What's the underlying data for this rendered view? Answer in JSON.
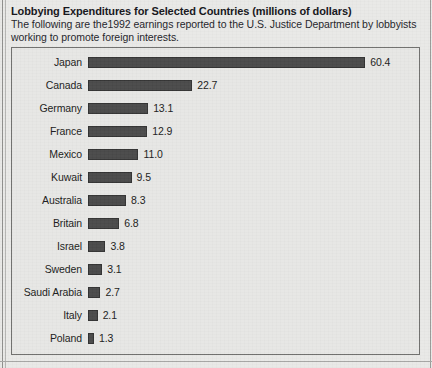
{
  "header": {
    "title": "Lobbying Expenditures for Selected Countries (millions of dollars)",
    "subtitle_line1": "The following are the1992 earnings reported to the U.S. Justice Department by lobbyists",
    "subtitle_line2": "working to promote foreign interests."
  },
  "colors": {
    "bar_fill": "#4a4a4a",
    "bar_stroke": "#333333",
    "plot_background": "#e7e7e5",
    "plot_border": "#6f6f6d",
    "page_background": "#e9e9e7",
    "text": "#1b1b20"
  },
  "chart_data": {
    "type": "bar",
    "orientation": "horizontal",
    "title": "Lobbying Expenditures for Selected Countries (millions of dollars)",
    "subtitle": "The following are the1992 earnings reported to the U.S. Justice Department by lobbyists working to promote foreign interests.",
    "xlabel": "",
    "ylabel": "",
    "unit": "millions of dollars",
    "grid": false,
    "legend": false,
    "xlim": [
      0,
      60.4
    ],
    "categories": [
      "Japan",
      "Canada",
      "Germany",
      "France",
      "Mexico",
      "Kuwait",
      "Australia",
      "Britain",
      "Israel",
      "Sweden",
      "Saudi Arabia",
      "Italy",
      "Poland"
    ],
    "values": [
      60.4,
      22.7,
      13.1,
      12.9,
      11.0,
      9.5,
      8.3,
      6.8,
      3.8,
      3.1,
      2.7,
      2.1,
      1.3
    ],
    "value_labels": [
      "60.4",
      "22.7",
      "13.1",
      "12.9",
      "11.0",
      "9.5",
      "8.3",
      "6.8",
      "3.8",
      "3.1",
      "2.7",
      "2.1",
      "1.3"
    ]
  }
}
